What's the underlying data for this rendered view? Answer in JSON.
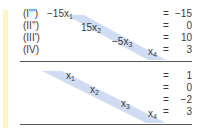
{
  "system_top": {
    "rows": [
      {
        "label": "(I''')",
        "coef": "−15x",
        "var_sub": "1",
        "eq": "=",
        "rhs": "−15"
      },
      {
        "label": "(II'')",
        "coef": "15x",
        "var_sub": "2",
        "eq": "=",
        "rhs": "0"
      },
      {
        "label": "(III')",
        "coef": "−5x",
        "var_sub": "3",
        "eq": "=",
        "rhs": "10"
      },
      {
        "label": "(IV)",
        "coef": "x",
        "var_sub": "4",
        "eq": "=",
        "rhs": "3"
      }
    ]
  },
  "system_bottom": {
    "rows": [
      {
        "coef": "x",
        "var_sub": "1",
        "eq": "=",
        "rhs": "1"
      },
      {
        "coef": "x",
        "var_sub": "2",
        "eq": "=",
        "rhs": "0"
      },
      {
        "coef": "x",
        "var_sub": "3",
        "eq": "=",
        "rhs": "−2"
      },
      {
        "coef": "x",
        "var_sub": "4",
        "eq": "=",
        "rhs": "3"
      }
    ]
  },
  "colors": {
    "accent_bar": "#fcf5c6",
    "diagonal_band": "#cfdcf2",
    "text": "#3a3a3a",
    "rule": "#555555"
  }
}
